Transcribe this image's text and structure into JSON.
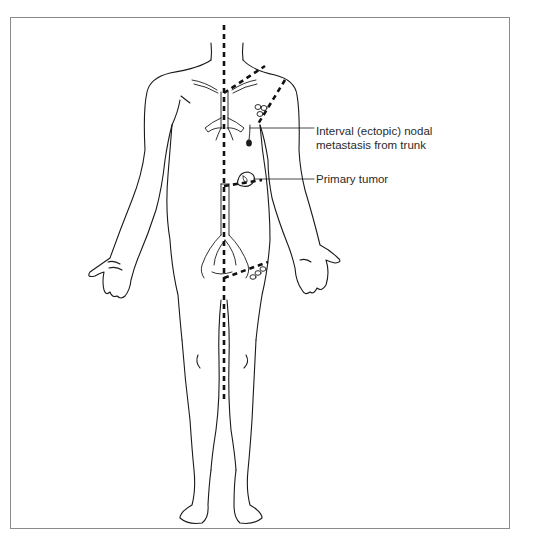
{
  "figure": {
    "line_color": "#1a1a1a",
    "frame_color": "#8a8a8a"
  },
  "labels": {
    "interval_metastasis": {
      "line1": "Interval (ectopic) nodal",
      "line2": "metastasis from trunk"
    },
    "primary_tumor": "Primary tumor"
  }
}
